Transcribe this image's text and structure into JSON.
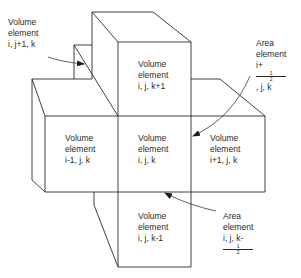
{
  "diagram": {
    "title": "",
    "line_color": "#2a2a2a",
    "volume_elements": [
      {
        "id": "top",
        "line1": "Volume",
        "line2": "element",
        "line3": "i, j, k+1"
      },
      {
        "id": "left",
        "line1": "Volume",
        "line2": "element",
        "line3": "i-1, j, k"
      },
      {
        "id": "center",
        "line1": "Volume",
        "line2": "element",
        "line3": "i, j, k"
      },
      {
        "id": "right",
        "line1": "Volume",
        "line2": "element",
        "line3": "i+1, j, k"
      },
      {
        "id": "bottom",
        "line1": "Volume",
        "line2": "element",
        "line3": "i, j, k-1"
      },
      {
        "id": "back",
        "line1": "Volume",
        "line2": "element",
        "line3": "i, j+1, k"
      }
    ],
    "area_elements": [
      {
        "id": "right-face",
        "line1": "Area",
        "line2": "element",
        "line3_prefix": "i+",
        "frac_num": "1",
        "frac_den": "2",
        "line3_suffix": ", j, k"
      },
      {
        "id": "bottom-face",
        "line1": "Area",
        "line2": "element",
        "line3_prefix": "i, j, k-",
        "frac_num": "1",
        "frac_den": "2",
        "line3_suffix": ""
      }
    ]
  }
}
